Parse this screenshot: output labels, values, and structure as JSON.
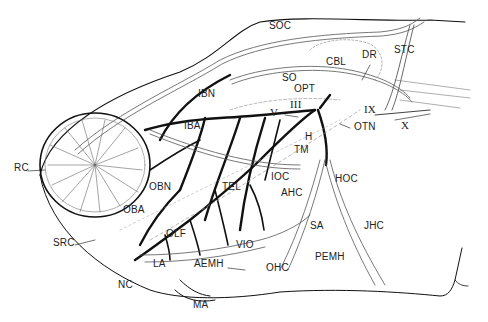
{
  "diagram": {
    "type": "anatomical line drawing",
    "colors": {
      "ink": "#111111",
      "canal": "#555555",
      "dotted": "#999999",
      "background": "#ffffff"
    },
    "labels": [
      {
        "id": "SOC",
        "text": "SOC",
        "x": 269,
        "y": 26
      },
      {
        "id": "STC",
        "text": "STC",
        "x": 394,
        "y": 50
      },
      {
        "id": "DR",
        "text": "DR",
        "x": 362,
        "y": 55
      },
      {
        "id": "CBL",
        "text": "CBL",
        "x": 326,
        "y": 62
      },
      {
        "id": "SO",
        "text": "SO",
        "x": 282,
        "y": 78
      },
      {
        "id": "OPT",
        "text": "OPT",
        "x": 294,
        "y": 89
      },
      {
        "id": "IBN",
        "text": "IBN",
        "x": 198,
        "y": 94
      },
      {
        "id": "V",
        "text": "V",
        "x": 270,
        "y": 112,
        "roman": true
      },
      {
        "id": "III",
        "text": "III",
        "x": 290,
        "y": 104,
        "roman": true
      },
      {
        "id": "IX",
        "text": "IX",
        "x": 364,
        "y": 109,
        "roman": true
      },
      {
        "id": "X",
        "text": "X",
        "x": 401,
        "y": 125,
        "roman": true
      },
      {
        "id": "IBA",
        "text": "IBA",
        "x": 184,
        "y": 126
      },
      {
        "id": "OTN",
        "text": "OTN",
        "x": 354,
        "y": 127
      },
      {
        "id": "H",
        "text": "H",
        "x": 305,
        "y": 137
      },
      {
        "id": "TM",
        "text": "TM",
        "x": 294,
        "y": 150
      },
      {
        "id": "RC",
        "text": "RC",
        "x": 14,
        "y": 168
      },
      {
        "id": "TEL",
        "text": "TEL",
        "x": 222,
        "y": 187
      },
      {
        "id": "IOC",
        "text": "IOC",
        "x": 271,
        "y": 177
      },
      {
        "id": "HOC",
        "text": "HOC",
        "x": 335,
        "y": 179
      },
      {
        "id": "OBN",
        "text": "OBN",
        "x": 149,
        "y": 187
      },
      {
        "id": "AHC",
        "text": "AHC",
        "x": 281,
        "y": 193
      },
      {
        "id": "OBA",
        "text": "OBA",
        "x": 123,
        "y": 210
      },
      {
        "id": "SA",
        "text": "SA",
        "x": 310,
        "y": 226
      },
      {
        "id": "JHC",
        "text": "JHC",
        "x": 364,
        "y": 226
      },
      {
        "id": "OLF",
        "text": "OLF",
        "x": 166,
        "y": 234
      },
      {
        "id": "VIO",
        "text": "VIO",
        "x": 236,
        "y": 245
      },
      {
        "id": "SRC",
        "text": "SRC",
        "x": 53,
        "y": 243
      },
      {
        "id": "PEMH",
        "text": "PEMH",
        "x": 315,
        "y": 257
      },
      {
        "id": "LA",
        "text": "LA",
        "x": 153,
        "y": 264
      },
      {
        "id": "AEMH",
        "text": "AEMH",
        "x": 194,
        "y": 264
      },
      {
        "id": "OHC",
        "text": "OHC",
        "x": 266,
        "y": 268
      },
      {
        "id": "NC",
        "text": "NC",
        "x": 118,
        "y": 285
      },
      {
        "id": "MA",
        "text": "MA",
        "x": 193,
        "y": 305
      }
    ]
  }
}
